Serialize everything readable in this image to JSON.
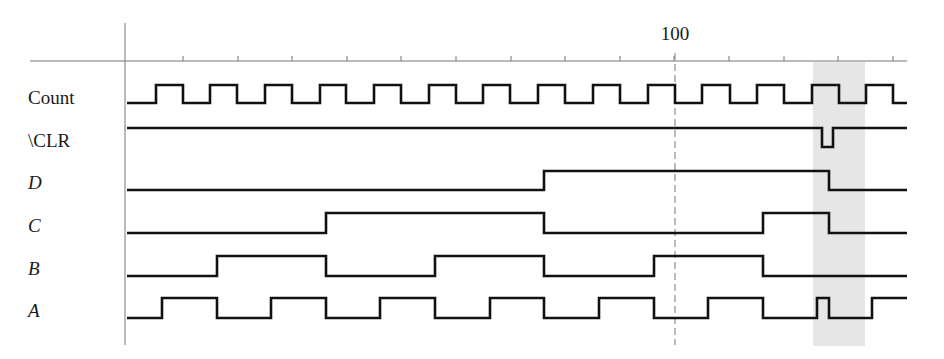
{
  "diagram": {
    "type": "timing-diagram",
    "axis": {
      "x_start": 125,
      "x_end": 907,
      "y_axis_top": 23,
      "y_axis_bottom": 345,
      "h_axis_y": 61,
      "h_axis_left": 30,
      "tick_first": 183,
      "tick_spacing": 54.6,
      "tick_count": 14,
      "marker": {
        "label": "100",
        "x": 675,
        "dashed": true
      }
    },
    "highlight": {
      "x": 813,
      "width": 52,
      "color": "#e6e6e6"
    },
    "colors": {
      "line": "#111111",
      "axis": "#777777",
      "text": "#1a1a1a"
    },
    "signals": [
      {
        "name": "Count",
        "italic": false,
        "label_y": 88,
        "high_y": 85,
        "low_y": 103,
        "points": [
          [
            127,
            103
          ],
          [
            156,
            103
          ],
          [
            156,
            85
          ],
          [
            183,
            85
          ],
          [
            183,
            103
          ],
          [
            210,
            103
          ],
          [
            210,
            85
          ],
          [
            237,
            85
          ],
          [
            237,
            103
          ],
          [
            265,
            103
          ],
          [
            265,
            85
          ],
          [
            292,
            85
          ],
          [
            292,
            103
          ],
          [
            320,
            103
          ],
          [
            320,
            85
          ],
          [
            346,
            85
          ],
          [
            346,
            103
          ],
          [
            374,
            103
          ],
          [
            374,
            85
          ],
          [
            401,
            85
          ],
          [
            401,
            103
          ],
          [
            429,
            103
          ],
          [
            429,
            85
          ],
          [
            456,
            85
          ],
          [
            456,
            103
          ],
          [
            483,
            103
          ],
          [
            483,
            85
          ],
          [
            510,
            85
          ],
          [
            510,
            103
          ],
          [
            538,
            103
          ],
          [
            538,
            85
          ],
          [
            565,
            85
          ],
          [
            565,
            103
          ],
          [
            593,
            103
          ],
          [
            593,
            85
          ],
          [
            620,
            85
          ],
          [
            620,
            103
          ],
          [
            648,
            103
          ],
          [
            648,
            85
          ],
          [
            675,
            85
          ],
          [
            675,
            103
          ],
          [
            702,
            103
          ],
          [
            702,
            85
          ],
          [
            730,
            85
          ],
          [
            730,
            103
          ],
          [
            757,
            103
          ],
          [
            757,
            85
          ],
          [
            784,
            85
          ],
          [
            784,
            103
          ],
          [
            812,
            103
          ],
          [
            812,
            85
          ],
          [
            839,
            85
          ],
          [
            839,
            103
          ],
          [
            866,
            103
          ],
          [
            866,
            85
          ],
          [
            893,
            85
          ],
          [
            893,
            103
          ],
          [
            907,
            103
          ]
        ]
      },
      {
        "name": "\\CLR",
        "italic": false,
        "label_y": 130,
        "high_y": 128,
        "low_y": 147,
        "points": [
          [
            127,
            128
          ],
          [
            822,
            128
          ],
          [
            822,
            147
          ],
          [
            833,
            147
          ],
          [
            833,
            128
          ],
          [
            907,
            128
          ]
        ]
      },
      {
        "name": "D",
        "italic": true,
        "label_y": 173,
        "high_y": 171,
        "low_y": 190,
        "points": [
          [
            127,
            190
          ],
          [
            544,
            190
          ],
          [
            544,
            171
          ],
          [
            829,
            171
          ],
          [
            829,
            190
          ],
          [
            907,
            190
          ]
        ]
      },
      {
        "name": "C",
        "italic": true,
        "label_y": 216,
        "high_y": 213,
        "low_y": 233,
        "points": [
          [
            127,
            233
          ],
          [
            326,
            233
          ],
          [
            326,
            213
          ],
          [
            544,
            213
          ],
          [
            544,
            233
          ],
          [
            763,
            233
          ],
          [
            763,
            213
          ],
          [
            829,
            213
          ],
          [
            829,
            233
          ],
          [
            907,
            233
          ]
        ]
      },
      {
        "name": "B",
        "italic": true,
        "label_y": 259,
        "high_y": 256,
        "low_y": 276,
        "points": [
          [
            127,
            276
          ],
          [
            217,
            276
          ],
          [
            217,
            256
          ],
          [
            326,
            256
          ],
          [
            326,
            276
          ],
          [
            435,
            276
          ],
          [
            435,
            256
          ],
          [
            544,
            256
          ],
          [
            544,
            276
          ],
          [
            654,
            276
          ],
          [
            654,
            256
          ],
          [
            763,
            256
          ],
          [
            763,
            276
          ],
          [
            907,
            276
          ]
        ]
      },
      {
        "name": "A",
        "italic": true,
        "label_y": 301,
        "high_y": 298,
        "low_y": 318,
        "points": [
          [
            127,
            318
          ],
          [
            162,
            318
          ],
          [
            162,
            298
          ],
          [
            217,
            298
          ],
          [
            217,
            318
          ],
          [
            271,
            318
          ],
          [
            271,
            298
          ],
          [
            326,
            298
          ],
          [
            326,
            318
          ],
          [
            380,
            318
          ],
          [
            380,
            298
          ],
          [
            435,
            298
          ],
          [
            435,
            318
          ],
          [
            490,
            318
          ],
          [
            490,
            298
          ],
          [
            544,
            298
          ],
          [
            544,
            318
          ],
          [
            599,
            318
          ],
          [
            599,
            298
          ],
          [
            654,
            298
          ],
          [
            654,
            318
          ],
          [
            708,
            318
          ],
          [
            708,
            298
          ],
          [
            763,
            298
          ],
          [
            763,
            318
          ],
          [
            817,
            318
          ],
          [
            817,
            298
          ],
          [
            829,
            298
          ],
          [
            829,
            318
          ],
          [
            872,
            318
          ],
          [
            872,
            298
          ],
          [
            907,
            298
          ]
        ]
      }
    ]
  }
}
